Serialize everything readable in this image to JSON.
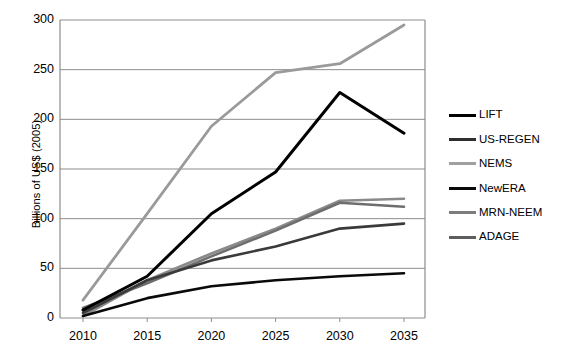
{
  "chart_data": {
    "type": "line",
    "title": "",
    "xlabel": "",
    "ylabel": "Billions of US$ (2005)",
    "x": [
      2010,
      2015,
      2020,
      2025,
      2030,
      2035
    ],
    "xtick_labels": [
      "2010",
      "2015",
      "2020",
      "2025",
      "2030",
      "2035"
    ],
    "ytick_labels": [
      "0",
      "50",
      "100",
      "150",
      "200",
      "250",
      "300"
    ],
    "yticks": [
      0,
      50,
      100,
      150,
      200,
      250,
      300
    ],
    "ylim": [
      0,
      300
    ],
    "xlim": [
      2008,
      2037
    ],
    "grid": "horizontal",
    "legend_position": "right",
    "series": [
      {
        "name": "LIFT",
        "color": "#000000",
        "width": 3.0,
        "values": [
          8,
          42,
          105,
          147,
          227,
          186
        ]
      },
      {
        "name": "US-REGEN",
        "color": "#3a3a3a",
        "width": 2.6,
        "values": [
          5,
          38,
          58,
          72,
          90,
          95
        ]
      },
      {
        "name": "NEMS",
        "color": "#9a9a9a",
        "width": 2.8,
        "values": [
          18,
          105,
          193,
          247,
          256,
          295
        ]
      },
      {
        "name": "NewERA",
        "color": "#0a0a0a",
        "width": 2.6,
        "values": [
          2,
          20,
          32,
          38,
          42,
          45
        ]
      },
      {
        "name": "MRN-NEEM",
        "color": "#8a8a8a",
        "width": 2.6,
        "values": [
          2,
          38,
          65,
          90,
          118,
          120
        ]
      },
      {
        "name": "ADAGE",
        "color": "#6e6e6e",
        "width": 2.6,
        "values": [
          10,
          35,
          62,
          88,
          116,
          112
        ]
      }
    ]
  },
  "legend": {
    "items": [
      {
        "label": "LIFT",
        "color": "#000000"
      },
      {
        "label": "US-REGEN",
        "color": "#2e2e2e"
      },
      {
        "label": "NEMS",
        "color": "#a0a0a0"
      },
      {
        "label": "NewERA",
        "color": "#0a0a0a"
      },
      {
        "label": "MRN-NEEM",
        "color": "#7d7d7d"
      },
      {
        "label": "ADAGE",
        "color": "#5e5e5e"
      }
    ]
  },
  "axes": {
    "border_color": "#8c8c8c",
    "grid_color": "#8c8c8c"
  }
}
